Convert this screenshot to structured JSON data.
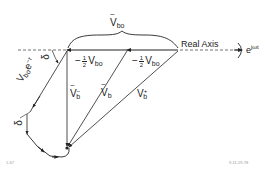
{
  "diagram": {
    "axis": {
      "label": "Real Axis",
      "rotation_label_base": "e",
      "rotation_label_exp": "jωt"
    },
    "labels": {
      "vbo_tilde": {
        "base": "V",
        "sub": "bo"
      },
      "half_vbo_left": {
        "sign": "−",
        "num": "1",
        "den": "2",
        "base": "V",
        "sub": "bo"
      },
      "half_vbo_right": {
        "sign": "−",
        "num": "1",
        "den": "2",
        "base": "V",
        "sub": "bo"
      },
      "vbo_etau": {
        "base": "V",
        "sub": "bo",
        "suffix": "e",
        "exp": "−τ"
      },
      "vb_minus": {
        "base": "V",
        "sub": "b",
        "sup": "−"
      },
      "vb": {
        "base": "V",
        "sub": "b"
      },
      "vb_plus": {
        "base": "V",
        "sub": "b",
        "sup": "+"
      },
      "delta_top": "δ",
      "delta_bottom": "δ"
    },
    "footnotes": {
      "left": "1-67",
      "right": "9-11-29-78"
    },
    "colors": {
      "ink": "#222222",
      "background": "#ffffff"
    }
  }
}
